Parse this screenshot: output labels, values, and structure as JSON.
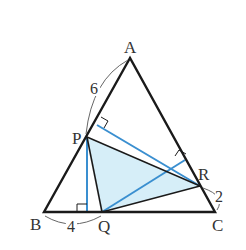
{
  "diagram": {
    "type": "geometry",
    "points": {
      "A": {
        "label": "A",
        "x": 130,
        "y": 58
      },
      "B": {
        "label": "B",
        "x": 44,
        "y": 212
      },
      "C": {
        "label": "C",
        "x": 215,
        "y": 212
      },
      "P": {
        "label": "P",
        "x": 87,
        "y": 137
      },
      "Q": {
        "label": "Q",
        "x": 102,
        "y": 212
      },
      "R": {
        "label": "R",
        "x": 200,
        "y": 186
      }
    },
    "lengths": {
      "AP": "6",
      "BQ": "4",
      "RC": "2"
    },
    "colors": {
      "triangle_stroke": "#1a1a1a",
      "perpendicular": "#3a8fd0",
      "shaded_fill": "#d6eef8",
      "annotation": "#555555"
    }
  }
}
